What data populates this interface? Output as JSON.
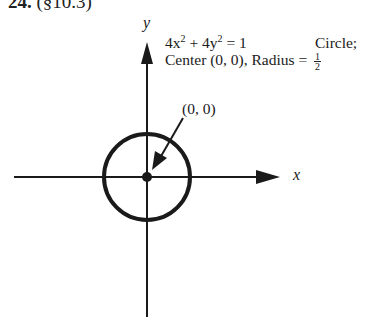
{
  "header": {
    "number": "24.",
    "section": "(§10.3)"
  },
  "axes": {
    "x_label": "x",
    "y_label": "y"
  },
  "annotation": {
    "equation_lhs_a": "4x",
    "equation_exp_a": "2",
    "equation_plus": " + 4y",
    "equation_exp_b": "2",
    "equation_rhs": " = 1",
    "type": "Circle;",
    "center_text": "Center (0, 0), Radius = ",
    "radius_num": "1",
    "radius_den": "2"
  },
  "point_label": "(0, 0)",
  "colors": {
    "ink": "#1a1a1a",
    "background": "#ffffff"
  },
  "geometry": {
    "center_px": [
      147,
      177
    ],
    "radius_px": 43,
    "circle_equation": "4x^2 + 4y^2 = 1",
    "center": [
      0,
      0
    ],
    "radius": 0.5
  }
}
